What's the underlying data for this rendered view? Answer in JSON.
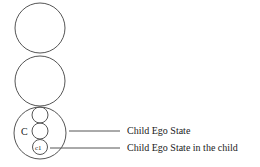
{
  "diagram": {
    "circles": [
      {
        "name": "top-circle",
        "cx": 40,
        "cy": 28,
        "r": 25
      },
      {
        "name": "middle-circle",
        "cx": 40,
        "cy": 81,
        "r": 25
      },
      {
        "name": "child-circle",
        "cx": 40,
        "cy": 134,
        "r": 26
      }
    ],
    "inner_circles": [
      {
        "name": "inner-circle-1",
        "cx": 40,
        "cy": 115,
        "r": 8
      },
      {
        "name": "inner-circle-2",
        "cx": 40,
        "cy": 131,
        "r": 8
      },
      {
        "name": "inner-circle-c1",
        "cx": 40,
        "cy": 148,
        "r": 7.5
      }
    ],
    "child_label": "C",
    "c1_label": "c1",
    "labels": {
      "child_ego_state": "Child Ego State",
      "child_in_child": "Child Ego State in the child"
    },
    "stroke_color": "#555555"
  }
}
